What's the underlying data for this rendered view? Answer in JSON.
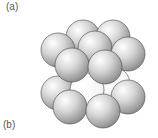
{
  "labels": {
    "a": "(a)",
    "b": "(b)"
  },
  "diagram": {
    "type": "sphere-packing",
    "sphere_color": "#cfcfcf",
    "highlight_color": "#ffffff",
    "outline_color": "#444444",
    "layers": [
      {
        "name": "bottom",
        "spheres": [
          {
            "cx": 113,
            "cy": 84,
            "r": 17,
            "shade": "light"
          },
          {
            "cx": 58,
            "cy": 93,
            "r": 17,
            "shade": "grey"
          },
          {
            "cx": 128,
            "cy": 97,
            "r": 17,
            "shade": "grey"
          },
          {
            "cx": 87,
            "cy": 90,
            "r": 17,
            "shade": "light"
          },
          {
            "cx": 70,
            "cy": 107,
            "r": 17,
            "shade": "grey"
          },
          {
            "cx": 103,
            "cy": 111,
            "r": 17,
            "shade": "grey"
          }
        ]
      },
      {
        "name": "top",
        "spheres": [
          {
            "cx": 83,
            "cy": 37,
            "r": 17,
            "shade": "grey"
          },
          {
            "cx": 113,
            "cy": 37,
            "r": 17,
            "shade": "grey"
          },
          {
            "cx": 58,
            "cy": 50,
            "r": 17,
            "shade": "grey"
          },
          {
            "cx": 95,
            "cy": 48,
            "r": 17,
            "shade": "grey"
          },
          {
            "cx": 128,
            "cy": 54,
            "r": 17,
            "shade": "grey"
          },
          {
            "cx": 72,
            "cy": 65,
            "r": 17,
            "shade": "grey"
          },
          {
            "cx": 105,
            "cy": 67,
            "r": 17,
            "shade": "grey"
          }
        ]
      }
    ]
  }
}
